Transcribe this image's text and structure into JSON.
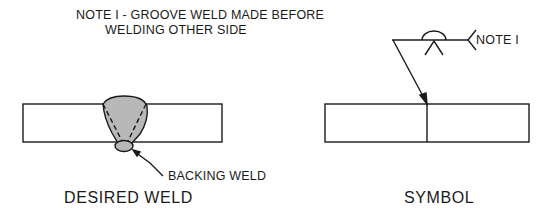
{
  "note": {
    "line1": "NOTE I - GROOVE WELD MADE  BEFORE",
    "line2": "WELDING OTHER SIDE"
  },
  "desired_weld": {
    "callout": "BACKING WELD",
    "caption": "DESIRED WELD",
    "weld_fill": "#b8b8b8"
  },
  "symbol": {
    "tail_text": "NOTE I",
    "caption": "SYMBOL"
  },
  "colors": {
    "line": "#1a1a1a",
    "background": "#ffffff"
  }
}
